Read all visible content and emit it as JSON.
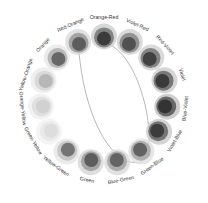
{
  "diagram": {
    "type": "color-wheel",
    "center": [
      104,
      100
    ],
    "ring_radius": 62,
    "label_radius": 82,
    "connector": {
      "from": "Red-Orange",
      "to": "Green-Blue",
      "stroke": "#9a9a9a"
    },
    "hues": [
      {
        "label": "Orange-Red",
        "angle": -90,
        "shades": [
          "#d0d0d0",
          "#7a7a7a",
          "#333333"
        ]
      },
      {
        "label": "Violet-Red",
        "angle": -66,
        "shades": [
          "#d4d4d4",
          "#8a8a8a",
          "#4a4a4a"
        ]
      },
      {
        "label": "Red-Violet",
        "angle": -42,
        "shades": [
          "#d4d4d4",
          "#7a7a7a",
          "#3a3a3a"
        ]
      },
      {
        "label": "Violet",
        "angle": -18,
        "shades": [
          "#cfcfcf",
          "#6e6e6e",
          "#333333"
        ]
      },
      {
        "label": "Blue-Violet",
        "angle": 6,
        "shades": [
          "#c6c6c6",
          "#5c5c5c",
          "#2e2e2e"
        ]
      },
      {
        "label": "Violet-Blue",
        "angle": 30,
        "shades": [
          "#cccccc",
          "#6a6a6a",
          "#363636"
        ]
      },
      {
        "label": "Green-Blue",
        "angle": 54,
        "shades": [
          "#e2e2e2",
          "#a8a8a8",
          "#5a5a5a"
        ]
      },
      {
        "label": "Blue-Green",
        "angle": 78,
        "shades": [
          "#dcdcdc",
          "#a6a6a6",
          "#5c5c5c"
        ]
      },
      {
        "label": "Green",
        "angle": 102,
        "shades": [
          "#d8d8d8",
          "#9e9e9e",
          "#555555"
        ]
      },
      {
        "label": "Yellow-Green",
        "angle": 126,
        "shades": [
          "#e8e8e8",
          "#c4c4c4",
          "#6a6a6a"
        ]
      },
      {
        "label": "Green-Yellow",
        "angle": 150,
        "shades": [
          "#f2f2f2",
          "#e8e8e8",
          "#dcdcdc"
        ]
      },
      {
        "label": "Orange-Yellow",
        "angle": 174,
        "shades": [
          "#f0f0f0",
          "#dedede",
          "#cfcfcf"
        ]
      },
      {
        "label": "Yellow-Orange",
        "angle": 198,
        "shades": [
          "#ececec",
          "#d6d6d6",
          "#b2b2b2"
        ]
      },
      {
        "label": "Orange",
        "angle": 222,
        "shades": [
          "#e8e8e8",
          "#b4b4b4",
          "#5e5e5e"
        ]
      },
      {
        "label": "Red-Orange",
        "angle": 246,
        "shades": [
          "#dcdcdc",
          "#9c9c9c",
          "#555555"
        ]
      }
    ]
  }
}
